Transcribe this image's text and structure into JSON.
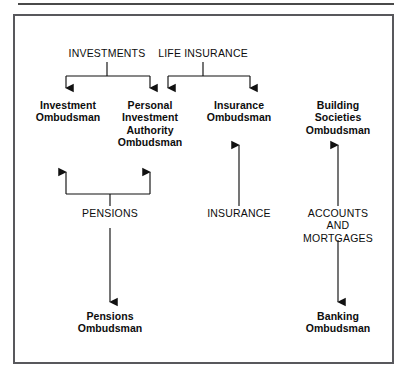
{
  "figure": {
    "kind": "flow-diagram",
    "title_rule": "",
    "colors": {
      "ink": "#0d0d0d",
      "frame": "#58585c",
      "rule": "#4a4a4a",
      "arrow": "#111111",
      "background": "#ffffff"
    }
  },
  "categories_top": [
    {
      "id": "investments",
      "label": "INVESTMENTS",
      "cx": 107,
      "cy": 55
    },
    {
      "id": "life-insurance",
      "label": "LIFE INSURANCE",
      "cx": 203,
      "cy": 55
    }
  ],
  "ombudsmen": [
    {
      "id": "investment-ombudsman",
      "label": "Investment\nOmbudsman",
      "cx": 68,
      "cy": 105
    },
    {
      "id": "personal-investment-authority-ombudsman",
      "label": "Personal\nInvestment\nAuthority\nOmbudsman",
      "cx": 150,
      "cy": 105
    },
    {
      "id": "insurance-ombudsman",
      "label": "Insurance\nOmbudsman",
      "cx": 239,
      "cy": 105
    },
    {
      "id": "building-societies-ombudsman",
      "label": "Building Societies\nOmbudsman",
      "cx": 338,
      "cy": 105
    },
    {
      "id": "pensions-ombudsman",
      "label": "Pensions\nOmbudsman",
      "cx": 110,
      "cy": 316
    },
    {
      "id": "banking-ombudsman",
      "label": "Banking\nOmbudsman",
      "cx": 338,
      "cy": 316
    }
  ],
  "categories_middle": [
    {
      "id": "pensions",
      "label": "PENSIONS",
      "cx": 110,
      "cy": 214
    },
    {
      "id": "insurance",
      "label": "INSURANCE",
      "cx": 239,
      "cy": 214
    },
    {
      "id": "accounts-and-mortgages",
      "label": "ACCOUNTS AND\nMORTGAGES",
      "cx": 338,
      "cy": 214
    }
  ],
  "connections": [
    {
      "id": "investments-to-investment-ombudsman",
      "from": "investments",
      "to": "investment-ombudsman",
      "direction": "down"
    },
    {
      "id": "investments-to-pia-ombudsman",
      "from": "investments",
      "to": "personal-investment-authority-ombudsman",
      "direction": "down"
    },
    {
      "id": "life-insurance-to-pia-ombudsman",
      "from": "life-insurance",
      "to": "personal-investment-authority-ombudsman",
      "direction": "down"
    },
    {
      "id": "life-insurance-to-insurance-ombudsman",
      "from": "life-insurance",
      "to": "insurance-ombudsman",
      "direction": "down"
    },
    {
      "id": "pensions-to-investment-ombudsman",
      "from": "pensions",
      "to": "investment-ombudsman",
      "direction": "up"
    },
    {
      "id": "pensions-to-pia-ombudsman",
      "from": "pensions",
      "to": "personal-investment-authority-ombudsman",
      "direction": "up"
    },
    {
      "id": "insurance-to-insurance-ombudsman",
      "from": "insurance",
      "to": "insurance-ombudsman",
      "direction": "up"
    },
    {
      "id": "accounts-to-building-societies-ombudsman",
      "from": "accounts-and-mortgages",
      "to": "building-societies-ombudsman",
      "direction": "up"
    },
    {
      "id": "pensions-to-pensions-ombudsman",
      "from": "pensions",
      "to": "pensions-ombudsman",
      "direction": "down"
    },
    {
      "id": "accounts-to-banking-ombudsman",
      "from": "accounts-and-mortgages",
      "to": "banking-ombudsman",
      "direction": "down"
    }
  ]
}
